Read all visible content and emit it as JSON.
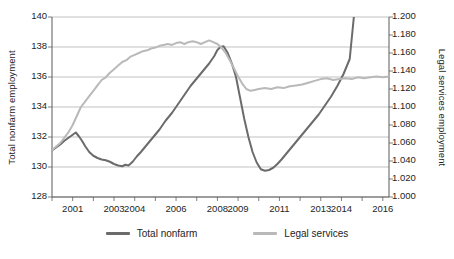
{
  "chart_data": {
    "type": "line",
    "title": "",
    "xlabel": "",
    "ylabel": "Total nonfarm employment",
    "y2label": "Legal services employment",
    "grid": true,
    "legend_position": "bottom",
    "xlim": [
      2000.0,
      2016.3
    ],
    "ylim": [
      128,
      140
    ],
    "y2lim": [
      1.0,
      1.2
    ],
    "x_tick_labels": [
      "2001",
      "2003",
      "2004",
      "2006",
      "2008",
      "2009",
      "2011",
      "2013",
      "2014",
      "2016"
    ],
    "x_tick_values": [
      2001,
      2003,
      2004,
      2006,
      2008,
      2009,
      2011,
      2013,
      2014,
      2016
    ],
    "y_tick_labels": [
      "140",
      "138",
      "136",
      "134",
      "132",
      "130",
      "128"
    ],
    "y_tick_values": [
      140,
      138,
      136,
      134,
      132,
      130,
      128
    ],
    "y2_tick_labels": [
      "1.200",
      "1.180",
      "1.160",
      "1.140",
      "1.120",
      "1.100",
      "1.080",
      "1.060",
      "1.040",
      "1.020",
      "1.000"
    ],
    "y2_tick_values": [
      1.2,
      1.18,
      1.16,
      1.14,
      1.12,
      1.1,
      1.08,
      1.06,
      1.04,
      1.02,
      1.0
    ],
    "series": [
      {
        "name": "Total nonfarm",
        "axis": "left",
        "color": "#6b6b6b",
        "x": [
          2000.0,
          2000.2,
          2000.4,
          2000.6,
          2000.8,
          2001.0,
          2001.15,
          2001.3,
          2001.45,
          2001.6,
          2001.8,
          2002.0,
          2002.2,
          2002.4,
          2002.6,
          2002.8,
          2003.0,
          2003.2,
          2003.4,
          2003.55,
          2003.7,
          2003.9,
          2004.1,
          2004.3,
          2004.6,
          2004.9,
          2005.2,
          2005.5,
          2005.8,
          2006.1,
          2006.4,
          2006.7,
          2007.0,
          2007.3,
          2007.6,
          2007.85,
          2008.0,
          2008.15,
          2008.3,
          2008.5,
          2008.7,
          2008.9,
          2009.1,
          2009.3,
          2009.5,
          2009.7,
          2009.9,
          2010.1,
          2010.3,
          2010.5,
          2010.7,
          2010.9,
          2011.1,
          2011.4,
          2011.7,
          2012.0,
          2012.3,
          2012.6,
          2012.9,
          2013.2,
          2013.5,
          2013.8,
          2014.1,
          2014.4,
          2014.6
        ],
        "y": [
          131.1,
          131.3,
          131.5,
          131.75,
          131.95,
          132.15,
          132.3,
          132.05,
          131.75,
          131.4,
          131.0,
          130.75,
          130.6,
          130.5,
          130.45,
          130.35,
          130.2,
          130.1,
          130.05,
          130.15,
          130.1,
          130.35,
          130.7,
          131.0,
          131.5,
          132.0,
          132.5,
          133.1,
          133.6,
          134.2,
          134.8,
          135.4,
          135.9,
          136.4,
          136.9,
          137.4,
          137.8,
          138.0,
          138.05,
          137.6,
          136.9,
          136.0,
          134.6,
          133.2,
          132.0,
          131.0,
          130.3,
          129.85,
          129.75,
          129.8,
          129.95,
          130.2,
          130.5,
          131.0,
          131.5,
          132.0,
          132.5,
          133.0,
          133.5,
          134.1,
          134.7,
          135.4,
          136.2,
          137.2,
          140.0
        ]
      },
      {
        "name": "Legal services",
        "axis": "right",
        "color": "#b9b9b9",
        "x": [
          2000.0,
          2000.2,
          2000.4,
          2000.6,
          2000.8,
          2001.0,
          2001.2,
          2001.4,
          2001.6,
          2001.8,
          2002.0,
          2002.2,
          2002.4,
          2002.6,
          2002.8,
          2003.0,
          2003.2,
          2003.4,
          2003.6,
          2003.8,
          2004.0,
          2004.2,
          2004.4,
          2004.6,
          2004.8,
          2005.0,
          2005.2,
          2005.4,
          2005.6,
          2005.8,
          2006.0,
          2006.2,
          2006.4,
          2006.6,
          2006.8,
          2007.0,
          2007.2,
          2007.4,
          2007.6,
          2007.8,
          2008.0,
          2008.2,
          2008.4,
          2008.6,
          2008.8,
          2009.0,
          2009.2,
          2009.4,
          2009.6,
          2009.8,
          2010.0,
          2010.3,
          2010.6,
          2010.9,
          2011.2,
          2011.5,
          2011.8,
          2012.1,
          2012.4,
          2012.7,
          2013.0,
          2013.3,
          2013.6,
          2013.9,
          2014.2,
          2014.5,
          2014.8,
          2015.1,
          2015.4,
          2015.7,
          2016.0,
          2016.3
        ],
        "y": [
          1.052,
          1.056,
          1.06,
          1.066,
          1.072,
          1.08,
          1.09,
          1.1,
          1.106,
          1.112,
          1.118,
          1.124,
          1.13,
          1.133,
          1.138,
          1.142,
          1.146,
          1.15,
          1.152,
          1.156,
          1.158,
          1.16,
          1.162,
          1.163,
          1.165,
          1.166,
          1.168,
          1.169,
          1.17,
          1.169,
          1.171,
          1.172,
          1.17,
          1.172,
          1.173,
          1.172,
          1.17,
          1.172,
          1.174,
          1.172,
          1.17,
          1.166,
          1.16,
          1.152,
          1.143,
          1.134,
          1.126,
          1.12,
          1.118,
          1.119,
          1.12,
          1.121,
          1.12,
          1.122,
          1.121,
          1.123,
          1.124,
          1.125,
          1.127,
          1.129,
          1.131,
          1.132,
          1.13,
          1.131,
          1.132,
          1.131,
          1.133,
          1.132,
          1.133,
          1.134,
          1.133,
          1.134
        ]
      }
    ],
    "legend": [
      {
        "label": "Total nonfarm",
        "color": "#6b6b6b"
      },
      {
        "label": "Legal services",
        "color": "#b9b9b9"
      }
    ]
  }
}
